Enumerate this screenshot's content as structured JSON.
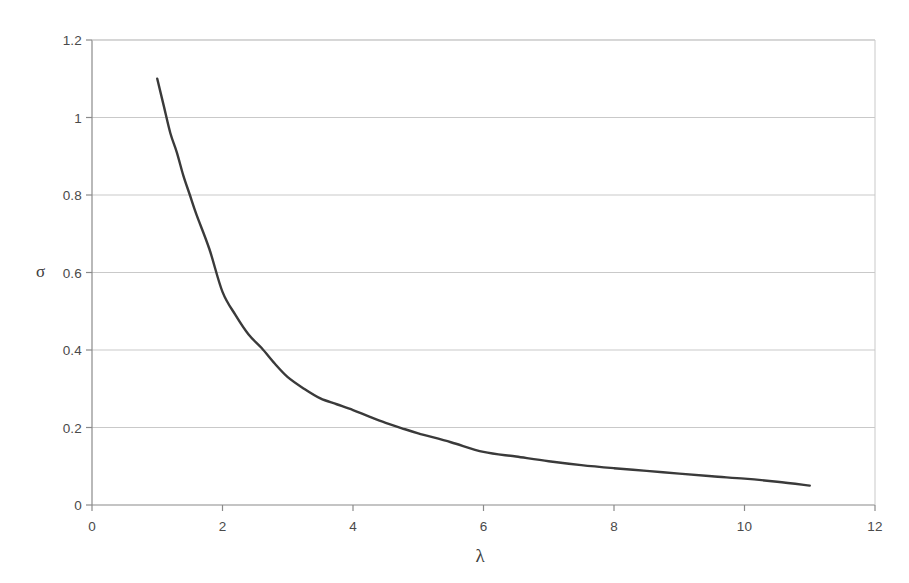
{
  "chart_data": {
    "type": "line",
    "title": "",
    "subtitle": "",
    "xlabel": "λ",
    "ylabel": "σ",
    "xlim": [
      0,
      12
    ],
    "ylim": [
      0,
      1.2
    ],
    "xticks": [
      "0",
      "2",
      "4",
      "6",
      "8",
      "10",
      "12"
    ],
    "xtick_values": [
      0,
      2,
      4,
      6,
      8,
      10,
      12
    ],
    "yticks": [
      "0",
      "0.2",
      "0.4",
      "0.6",
      "0.8",
      "1",
      "1.2"
    ],
    "ytick_values": [
      0,
      0.2,
      0.4,
      0.6,
      0.8,
      1,
      1.2
    ],
    "grid": "horizontal",
    "legend": "none",
    "annotations": [],
    "series": [
      {
        "name": "sigma-vs-lambda",
        "color": "#3a3a3a",
        "line_width": 2.4,
        "x": [
          1.0,
          1.1,
          1.2,
          1.3,
          1.4,
          1.5,
          1.6,
          1.8,
          2.0,
          2.2,
          2.4,
          2.6,
          2.8,
          3.0,
          3.25,
          3.5,
          3.75,
          4.0,
          4.25,
          4.5,
          4.75,
          5.0,
          5.5,
          6.0,
          6.5,
          7.0,
          7.5,
          8.0,
          8.5,
          9.0,
          9.5,
          10.0,
          10.5,
          11.0
        ],
        "y": [
          1.1,
          1.03,
          0.96,
          0.91,
          0.85,
          0.8,
          0.75,
          0.66,
          0.55,
          0.49,
          0.44,
          0.405,
          0.365,
          0.33,
          0.3,
          0.275,
          0.26,
          0.245,
          0.228,
          0.212,
          0.198,
          0.185,
          0.162,
          0.137,
          0.125,
          0.113,
          0.103,
          0.095,
          0.088,
          0.081,
          0.074,
          0.068,
          0.06,
          0.05
        ]
      }
    ]
  },
  "plot_geometry": {
    "left_px": 92,
    "right_px": 875,
    "top_px": 40,
    "bottom_px": 505
  },
  "colors": {
    "curve": "#3a3a3a",
    "gridline": "#c9c9c9",
    "axis": "#8a8a8a",
    "background": "#ffffff",
    "text": "#4a4a4a"
  }
}
